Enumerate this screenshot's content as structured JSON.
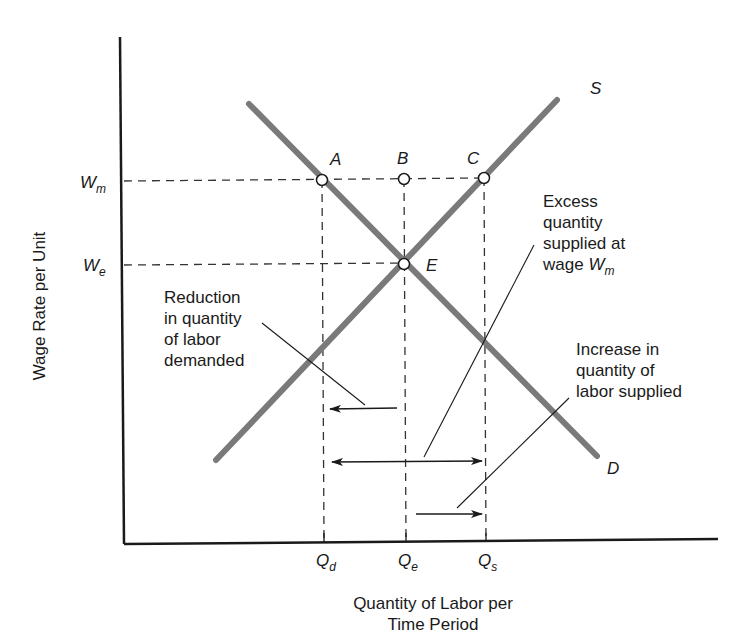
{
  "diagram": {
    "y_axis_label": "Wage Rate per Unit",
    "x_axis_label_line1": "Quantity of Labor per",
    "x_axis_label_line2": "Time Period",
    "y_ticks": [
      {
        "main": "W",
        "sub": "m"
      },
      {
        "main": "W",
        "sub": "e"
      }
    ],
    "x_ticks": [
      {
        "main": "Q",
        "sub": "d"
      },
      {
        "main": "Q",
        "sub": "e"
      },
      {
        "main": "Q",
        "sub": "s"
      }
    ],
    "curves": {
      "supply": "S",
      "demand": "D"
    },
    "points": {
      "a": "A",
      "b": "B",
      "c": "C",
      "e": "E"
    },
    "annotations": {
      "reduction": [
        "Reduction",
        "in quantity",
        "of labor",
        "demanded"
      ],
      "excess": [
        "Excess",
        "quantity",
        "supplied at"
      ],
      "excess_last": "wage ",
      "excess_w": "W",
      "excess_sub": "m",
      "increase": [
        "Increase in",
        "quantity of",
        "labor supplied"
      ]
    },
    "colors": {
      "curve": "#7a7a7a",
      "axis": "#1a1a1a",
      "dashed": "#333333",
      "text": "#1a1a1a"
    }
  }
}
